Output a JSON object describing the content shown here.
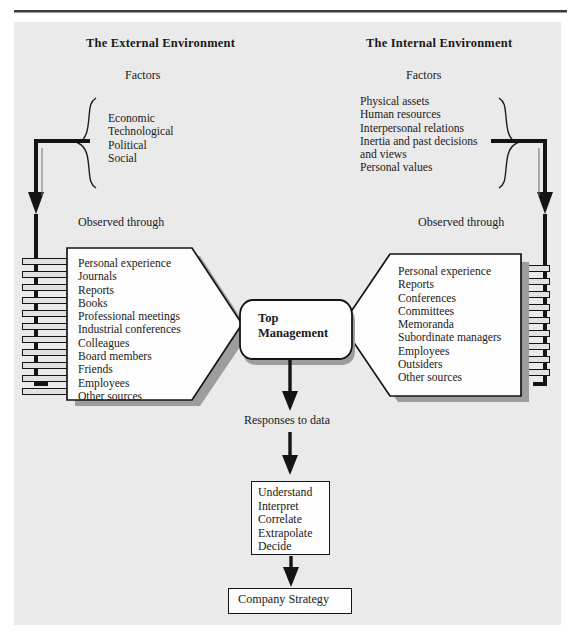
{
  "diagram": {
    "background_color": "#eaeaea",
    "line_color": "#141414"
  },
  "left_column": {
    "heading": "The External Environment",
    "factors_label": "Factors",
    "factors": [
      "Economic",
      "Technological",
      "Political",
      "Social"
    ],
    "observed_label": "Observed through",
    "sources": [
      "Personal experience",
      "Journals",
      "Reports",
      "Books",
      "Professional meetings",
      "Industrial conferences",
      "Colleagues",
      "Board members",
      "Friends",
      "Employees",
      "Other sources"
    ]
  },
  "right_column": {
    "heading": "The Internal Environment",
    "factors_label": "Factors",
    "factors": [
      "Physical assets",
      "Human resources",
      "Interpersonal relations",
      "Inertia and past decisions",
      "and views",
      "Personal values"
    ],
    "observed_label": "Observed through",
    "sources": [
      "Personal experience",
      "Reports",
      "Conferences",
      "Committees",
      "Memoranda",
      "Subordinate managers",
      "Employees",
      "Outsiders",
      "Other sources"
    ]
  },
  "center": {
    "line1": "Top",
    "line2": "Management"
  },
  "flow": {
    "responses_label": "Responses to data",
    "process_steps": [
      "Understand",
      "Interpret",
      "Correlate",
      "Extrapolate",
      "Decide"
    ],
    "outcome": "Company Strategy"
  }
}
